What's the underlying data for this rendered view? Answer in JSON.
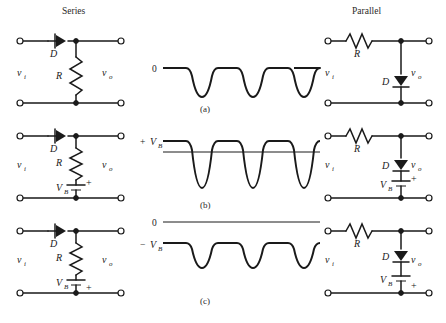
{
  "figure": {
    "columns": {
      "left_title": "Series",
      "right_title": "Parallel"
    },
    "row_captions": [
      "(a)",
      "(b)",
      "(c)"
    ],
    "labels": {
      "vi": "v",
      "vi_sub": "i",
      "vo": "v",
      "vo_sub": "o",
      "diode": "D",
      "resistor": "R",
      "battery": "V",
      "battery_sub": "B",
      "plus": "+",
      "minus": "−",
      "zero": "0",
      "plus_vb": "+",
      "minus_vb": "−"
    },
    "rows": [
      {
        "id": "a",
        "caption": "(a)",
        "series": {
          "diode_label": "D",
          "diode_direction": "left",
          "resistor_label": "R",
          "resistor_orientation": "vertical",
          "input_label": "v",
          "input_sub": "i",
          "output_label": "v",
          "output_sub": "o",
          "has_battery": false
        },
        "parallel": {
          "resistor_label": "R",
          "resistor_orientation": "horizontal",
          "diode_label": "D",
          "diode_direction": "down",
          "input_label": "v",
          "input_sub": "i",
          "output_label": "v",
          "output_sub": "o",
          "has_battery": false
        },
        "waveform": {
          "reference_label": "0",
          "reference_label_2": "",
          "clip_level_label": "0",
          "pulse_count": 3,
          "has_zero_line": false,
          "description": "Flat top at 0 with three negative half-sine pulses below"
        }
      },
      {
        "id": "b",
        "caption": "(b)",
        "series": {
          "diode_label": "D",
          "diode_direction": "left",
          "resistor_label": "R",
          "resistor_orientation": "vertical",
          "input_label": "v",
          "input_sub": "i",
          "output_label": "v",
          "output_sub": "o",
          "has_battery": true,
          "battery_label": "V",
          "battery_sub": "B",
          "battery_polarity": "plus-top"
        },
        "parallel": {
          "resistor_label": "R",
          "resistor_orientation": "horizontal",
          "diode_label": "D",
          "diode_direction": "down",
          "input_label": "v",
          "input_sub": "i",
          "output_label": "v",
          "output_sub": "o",
          "has_battery": true,
          "battery_label": "V",
          "battery_sub": "B",
          "battery_polarity": "plus-top"
        },
        "waveform": {
          "reference_label": "+",
          "reference_label_2": "V",
          "reference_sub": "B",
          "pulse_count": 3,
          "has_zero_line": true,
          "description": "Flat top at +VB with three negative half-sine pulses, thin zero reference line below the clip level"
        }
      },
      {
        "id": "c",
        "caption": "(c)",
        "series": {
          "diode_label": "D",
          "diode_direction": "left",
          "resistor_label": "R",
          "resistor_orientation": "vertical",
          "input_label": "v",
          "input_sub": "i",
          "output_label": "v",
          "output_sub": "o",
          "has_battery": true,
          "battery_label": "V",
          "battery_sub": "B",
          "battery_polarity": "plus-bottom"
        },
        "parallel": {
          "resistor_label": "R",
          "resistor_orientation": "horizontal",
          "diode_label": "D",
          "diode_direction": "down",
          "input_label": "v",
          "input_sub": "i",
          "output_label": "v",
          "output_sub": "o",
          "has_battery": true,
          "battery_label": "V",
          "battery_sub": "B",
          "battery_polarity": "plus-bottom"
        },
        "waveform": {
          "reference_label": "0",
          "reference_label_2": "−",
          "reference_label_3": "V",
          "reference_sub": "B",
          "pulse_count": 3,
          "has_zero_line": true,
          "description": "Thin zero line at top labelled 0; flat top at -VB with three shallow negative half-sine pulses"
        }
      }
    ],
    "colors": {
      "ink": "#1a1a1a",
      "background": "#ffffff"
    }
  }
}
